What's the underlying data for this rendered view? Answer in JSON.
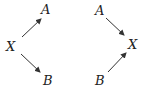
{
  "diagrams": [
    {
      "name": "left",
      "nodes": [
        {
          "id": "A",
          "label": "A",
          "x": 44,
          "y": 14
        },
        {
          "id": "X",
          "label": "X",
          "x": 12,
          "y": 50
        },
        {
          "id": "B",
          "label": "B",
          "x": 46,
          "y": 84
        }
      ],
      "edges": [
        {
          "from": "X",
          "to": "A"
        },
        {
          "from": "X",
          "to": "B"
        }
      ]
    },
    {
      "name": "right",
      "nodes": [
        {
          "id": "A",
          "label": "A",
          "x": 98,
          "y": 15
        },
        {
          "id": "X",
          "label": "X",
          "x": 132,
          "y": 48
        },
        {
          "id": "B",
          "label": "B",
          "x": 98,
          "y": 84
        }
      ],
      "edges": [
        {
          "from": "A",
          "to": "X"
        },
        {
          "from": "B",
          "to": "X"
        }
      ]
    }
  ]
}
